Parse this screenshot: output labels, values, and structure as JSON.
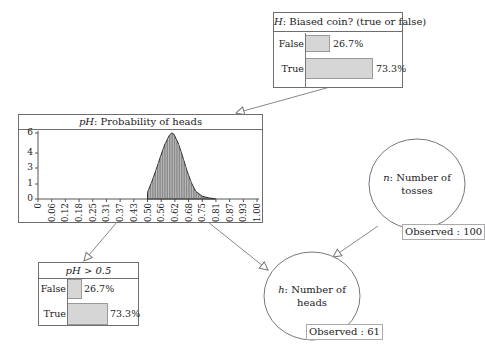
{
  "nodes": {
    "biased_coin": {
      "var": "H",
      "title": ": Biased coin? (true or false)",
      "states": [
        {
          "label": "False",
          "value": "26.7%",
          "pct": 26.7
        },
        {
          "label": "True",
          "value": "73.3%",
          "pct": 73.3
        }
      ]
    },
    "prob_heads": {
      "var": "pH",
      "title": ": Probability of heads"
    },
    "ph_gt": {
      "title": "pH > 0.5",
      "states": [
        {
          "label": "False",
          "value": "26.7%",
          "pct": 26.7
        },
        {
          "label": "True",
          "value": "73.3%",
          "pct": 73.3
        }
      ]
    },
    "tosses": {
      "var": "n",
      "line1": ": Number of",
      "line2": "tosses",
      "observed": "Observed : 100"
    },
    "heads": {
      "var": "h",
      "line1": ": Number of",
      "line2": "heads",
      "observed": "Observed : 61"
    }
  },
  "chart_data": {
    "type": "area",
    "title": "pH: Probability of heads",
    "xlabel": "",
    "ylabel": "",
    "x_ticks": [
      "0",
      "0.06",
      "0.12",
      "0.18",
      "0.25",
      "0.31",
      "0.37",
      "0.43",
      "0.50",
      "0.56",
      "0.62",
      "0.68",
      "0.75",
      "0.81",
      "0.87",
      "0.93",
      "1.00"
    ],
    "y_ticks": [
      "0",
      "1",
      "3",
      "4",
      "6"
    ],
    "xlim": [
      0,
      1
    ],
    "ylim": [
      0,
      6.4
    ],
    "x": [
      0.5,
      0.52,
      0.54,
      0.56,
      0.58,
      0.6,
      0.61,
      0.62,
      0.64,
      0.66,
      0.68,
      0.7,
      0.72,
      0.75,
      0.78,
      0.81
    ],
    "values": [
      0.6,
      1.6,
      2.7,
      3.9,
      5.0,
      5.8,
      6.0,
      5.9,
      5.1,
      3.9,
      2.6,
      1.5,
      0.7,
      0.25,
      0.1,
      0.02
    ]
  }
}
